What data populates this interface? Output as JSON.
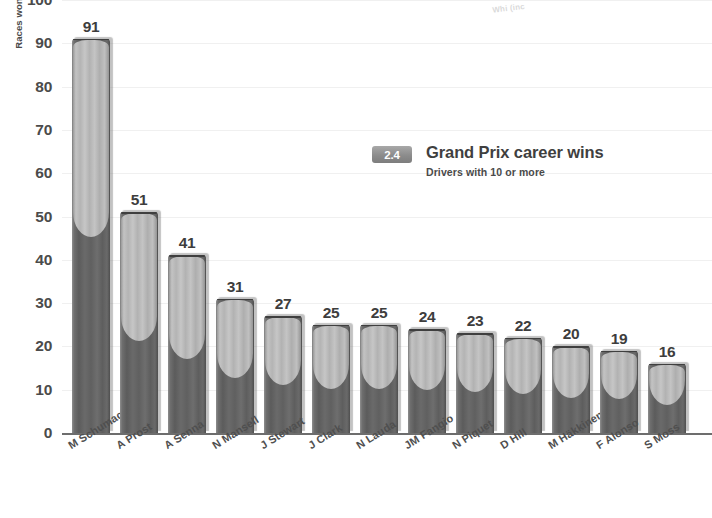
{
  "header": {
    "badge": "2.4",
    "title": "Grand Prix career wins",
    "subtitle": "Drivers with 10 or more",
    "top_cutoff_fragment_1": "Whi (inc",
    "top_cutoff_fragment_2": "✦"
  },
  "chart_data": {
    "type": "bar",
    "title": "Grand Prix career wins",
    "subtitle": "Drivers with 10 or more",
    "xlabel": "",
    "ylabel": "Races won",
    "ylim": [
      0,
      100
    ],
    "yticks": [
      0,
      10,
      20,
      30,
      40,
      50,
      60,
      70,
      80,
      90,
      100
    ],
    "grid": true,
    "legend": "none",
    "categories": [
      "M Schumacher",
      "A Prost",
      "A Senna",
      "N Mansell",
      "J Stewart",
      "J Clark",
      "N Lauda",
      "JM Fangio",
      "N Piquet",
      "D Hill",
      "M Häkkinen",
      "F Alonso",
      "S Moss"
    ],
    "values": [
      91,
      51,
      41,
      31,
      27,
      25,
      25,
      24,
      23,
      22,
      20,
      19,
      16
    ],
    "series": [
      {
        "name": "Races won",
        "values": [
          91,
          51,
          41,
          31,
          27,
          25,
          25,
          24,
          23,
          22,
          20,
          19,
          16
        ]
      }
    ]
  },
  "colors": {
    "bar_light": "#bcbcbc",
    "bar_dark": "#5e5e5e",
    "badge": "#8c8c8c",
    "text": "#3f3f3f",
    "axis": "#6d6d6d",
    "grid": "#f0f0f0",
    "background": "#ffffff"
  }
}
